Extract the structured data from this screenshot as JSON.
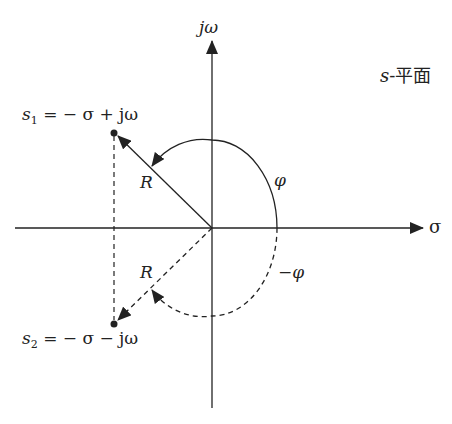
{
  "diagram": {
    "title": "s-平面",
    "plane_label": {
      "s": "s",
      "rest": "-平面"
    },
    "axes": {
      "x_label": "σ",
      "y_label": "jω"
    },
    "points": [
      {
        "name": "s1",
        "label_main": "s",
        "label_sub": "1",
        "label_rest": " = − σ + jω"
      },
      {
        "name": "s2",
        "label_main": "s",
        "label_sub": "2",
        "label_rest": " = − σ − jω"
      }
    ],
    "vector_labels": {
      "upper": "R",
      "lower": "R"
    },
    "angle_labels": {
      "positive": "φ",
      "negative": "−φ"
    },
    "colors": {
      "ink": "#222222",
      "background": "#ffffff"
    }
  }
}
